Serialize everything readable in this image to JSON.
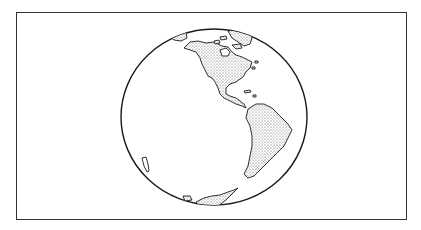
{
  "illustration": {
    "subject": "globe-western-hemisphere",
    "colors": {
      "line": "#1a1a1a",
      "background": "#ffffff",
      "land_stipple": "#555555"
    },
    "continents": [
      "North America",
      "South America",
      "Antarctica",
      "Greenland"
    ]
  }
}
